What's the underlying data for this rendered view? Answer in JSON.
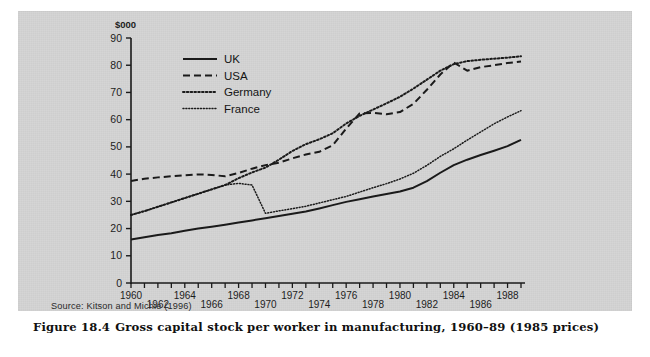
{
  "figure": {
    "source_text": "Source: Kitson and Michie (1996)",
    "caption_label": "Figure 18.4",
    "caption_text": "Gross capital stock per worker in manufacturing, 1960–89 (1985 prices)",
    "panel_color": "#d2d2d2",
    "ink_color": "#1a1a1a"
  },
  "chart_data": {
    "type": "line",
    "title": "Gross capital stock per worker in manufacturing, 1960–89 (1985 prices)",
    "xlabel": "",
    "ylabel": "$000",
    "unit_label": "$000",
    "xlim": [
      1960,
      1989
    ],
    "ylim": [
      0,
      90
    ],
    "yticks": [
      0,
      10,
      20,
      30,
      40,
      50,
      60,
      70,
      80,
      90
    ],
    "ytick_labels": [
      "0",
      "10",
      "20",
      "30",
      "40",
      "50",
      "60",
      "70",
      "80",
      "90"
    ],
    "xticks": [
      1960,
      1961,
      1962,
      1963,
      1964,
      1965,
      1966,
      1967,
      1968,
      1969,
      1970,
      1971,
      1972,
      1973,
      1974,
      1975,
      1976,
      1977,
      1978,
      1979,
      1980,
      1981,
      1982,
      1983,
      1984,
      1985,
      1986,
      1987,
      1988,
      1989
    ],
    "xtick_labels": [
      "1960",
      "1962",
      "1964",
      "1966",
      "1968",
      "1970",
      "1972",
      "1974",
      "1976",
      "1978",
      "1980",
      "1982",
      "1984",
      "1986",
      "1988"
    ],
    "xtick_label_years": [
      1960,
      1962,
      1964,
      1966,
      1968,
      1970,
      1972,
      1974,
      1976,
      1978,
      1980,
      1982,
      1984,
      1986,
      1988
    ],
    "grid": false,
    "legend_position": "upper left",
    "x": [
      1960,
      1961,
      1962,
      1963,
      1964,
      1965,
      1966,
      1967,
      1968,
      1969,
      1970,
      1971,
      1972,
      1973,
      1974,
      1975,
      1976,
      1977,
      1978,
      1979,
      1980,
      1981,
      1982,
      1983,
      1984,
      1985,
      1986,
      1987,
      1988,
      1989
    ],
    "series": [
      {
        "name": "UK",
        "style": "solid",
        "values": [
          16.0,
          16.8,
          17.6,
          18.3,
          19.2,
          20.0,
          20.7,
          21.4,
          22.2,
          23.0,
          23.8,
          24.6,
          25.4,
          26.3,
          27.4,
          28.6,
          29.8,
          30.8,
          31.8,
          32.7,
          33.6,
          35.0,
          37.4,
          40.5,
          43.3,
          45.3,
          47.0,
          48.6,
          50.3,
          52.6
        ]
      },
      {
        "name": "USA",
        "style": "dashed",
        "values": [
          37.5,
          38.3,
          38.8,
          39.2,
          39.6,
          39.9,
          39.7,
          39.2,
          40.4,
          42.0,
          43.3,
          44.2,
          45.8,
          47.2,
          48.2,
          50.6,
          56.7,
          62.3,
          62.5,
          62.0,
          62.8,
          65.8,
          71.0,
          76.6,
          81.0,
          78.0,
          79.3,
          80.0,
          80.8,
          81.4
        ]
      },
      {
        "name": "Germany",
        "style": "dotted-coarse",
        "values": [
          25.0,
          26.4,
          28.0,
          29.6,
          31.2,
          32.8,
          34.4,
          36.0,
          38.5,
          40.6,
          42.4,
          45.3,
          48.5,
          51.0,
          52.8,
          55.0,
          58.6,
          61.4,
          63.7,
          66.0,
          68.4,
          71.4,
          74.7,
          78.0,
          80.4,
          81.5,
          82.0,
          82.4,
          82.8,
          83.3
        ]
      },
      {
        "name": "France",
        "style": "dotted-fine",
        "values": [
          25.0,
          26.4,
          28.0,
          29.6,
          31.2,
          32.8,
          34.4,
          36.0,
          36.6,
          36.0,
          25.6,
          26.5,
          27.3,
          28.2,
          29.4,
          30.6,
          31.8,
          33.4,
          35.0,
          36.5,
          38.2,
          40.3,
          43.2,
          46.5,
          49.3,
          52.5,
          55.5,
          58.5,
          61.0,
          63.3
        ]
      }
    ],
    "legend": [
      {
        "label": "UK",
        "style": "solid"
      },
      {
        "label": "USA",
        "style": "dashed"
      },
      {
        "label": "Germany",
        "style": "dotted-coarse"
      },
      {
        "label": "France",
        "style": "dotted-fine"
      }
    ]
  }
}
